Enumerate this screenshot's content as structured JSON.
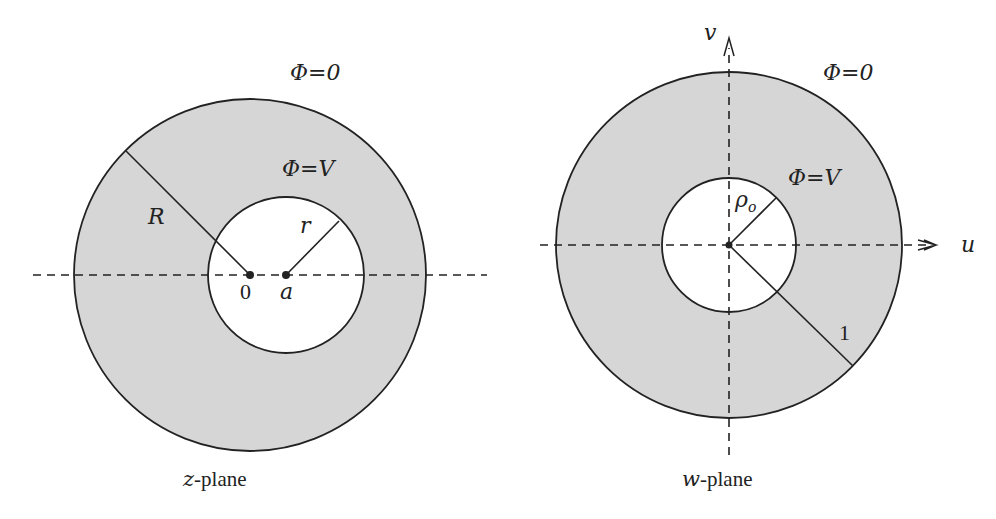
{
  "colors": {
    "annulus_fill": "#d6d6d6",
    "line": "#222222",
    "background": "#ffffff"
  },
  "z_plane": {
    "caption_var": "z",
    "caption_suffix": "-plane",
    "outer_label": "Φ=0",
    "inner_label": "Φ=V",
    "outer_radius_label": "R",
    "inner_radius_label": "r",
    "origin_label": "0",
    "offset_label": "a"
  },
  "w_plane": {
    "caption_var": "w",
    "caption_suffix": "-plane",
    "outer_label": "Φ=0",
    "inner_label": "Φ=V",
    "inner_radius_label": "ρ",
    "inner_radius_subscript": "o",
    "outer_radius_label": "1",
    "horizontal_axis_label": "u",
    "vertical_axis_label": "v"
  }
}
